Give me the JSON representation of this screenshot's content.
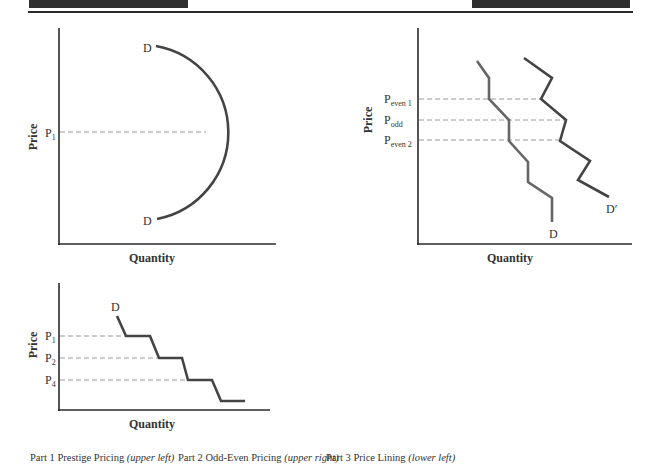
{
  "header": {
    "left_bar": {
      "x": 29,
      "width": 159
    },
    "right_bar": {
      "x": 472,
      "width": 158
    }
  },
  "colors": {
    "axis": "#2a2a2a",
    "curve": "#444444",
    "curve_light": "#666666",
    "dash": "#9a9a9a",
    "text": "#333333"
  },
  "charts": [
    {
      "id": "prestige",
      "ylabel": "Price",
      "xlabel": "Quantity",
      "price_labels": [
        {
          "main": "P",
          "sub": "1"
        }
      ],
      "curve_labels": {
        "top": "D",
        "bottom": "D"
      }
    },
    {
      "id": "odd-even",
      "ylabel": "Price",
      "xlabel": "Quantity",
      "price_labels": [
        {
          "main": "P",
          "sub": "even 1"
        },
        {
          "main": "P",
          "sub": "odd"
        },
        {
          "main": "P",
          "sub": "even 2"
        }
      ],
      "curve_labels": {
        "d": "D",
        "d_prime": "D′"
      }
    },
    {
      "id": "price-lining",
      "ylabel": "Price",
      "xlabel": "Quantity",
      "price_labels": [
        {
          "main": "P",
          "sub": "1"
        },
        {
          "main": "P",
          "sub": "2"
        },
        {
          "main": "P",
          "sub": "4"
        }
      ],
      "curve_labels": {
        "d": "D"
      }
    }
  ],
  "captions": [
    {
      "label": "Part 1 Prestige Pricing",
      "position": "(upper left)"
    },
    {
      "label": "Part 2 Odd-Even Pricing",
      "position": "(upper right)"
    },
    {
      "label": "Part 3 Price Lining",
      "position": "(lower left)"
    }
  ]
}
